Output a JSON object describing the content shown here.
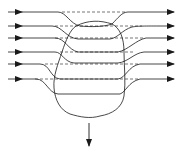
{
  "diagram": {
    "title": "",
    "stroke_color": "#1a1a1a",
    "background": "#ffffff",
    "streamlines": [
      {
        "id": "s1",
        "y_in": 12,
        "y_out": 12,
        "dip_y": 26
      },
      {
        "id": "s2",
        "y_in": 26,
        "y_out": 26,
        "dip_y": 38
      },
      {
        "id": "s3",
        "y_in": 38,
        "y_out": 38,
        "dip_y": 52
      },
      {
        "id": "s4",
        "y_in": 52,
        "y_out": 52,
        "dip_y": 64
      },
      {
        "id": "s5",
        "y_in": 64,
        "y_out": 64,
        "dip_y": 79
      },
      {
        "id": "s6",
        "y_in": 79,
        "y_out": 79,
        "dip_y": 94
      }
    ],
    "dashed_reference_lines_y": [
      12,
      26,
      38,
      52,
      64,
      79
    ],
    "body": {
      "label": "",
      "shape": "irregular-closed-blob"
    },
    "force_arrow": {
      "direction": "down",
      "label": ""
    }
  }
}
